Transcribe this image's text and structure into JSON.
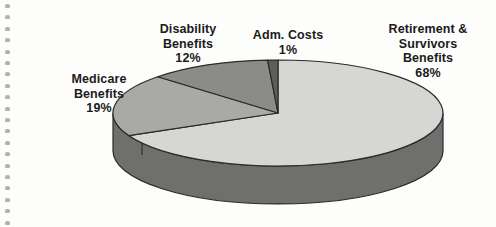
{
  "chart_data": {
    "type": "pie",
    "title": "",
    "subtitle": "",
    "xlabel": "",
    "ylabel": "",
    "legend_position": "none",
    "grid": false,
    "value_unit": "percent",
    "categories": [
      "Retirement & Survivors Benefits",
      "Medicare Benefits",
      "Disability Benefits",
      "Adm. Costs"
    ],
    "values": [
      68,
      19,
      12,
      1
    ],
    "labels": [
      "68%",
      "19%",
      "12%",
      "1%"
    ],
    "slices": [
      {
        "name": "Retirement & Survivors Benefits",
        "value": 68,
        "label": "68%",
        "color": "#d6d6d4",
        "start_angle_deg": 0,
        "end_angle_deg": 244.8
      },
      {
        "name": "Medicare Benefits",
        "value": 19,
        "label": "19%",
        "color": "#a9a9a6",
        "start_angle_deg": 244.8,
        "end_angle_deg": 313.2
      },
      {
        "name": "Disability Benefits",
        "value": 12,
        "label": "12%",
        "color": "#8b8b88",
        "start_angle_deg": 313.2,
        "end_angle_deg": 356.4
      },
      {
        "name": "Adm. Costs",
        "value": 1,
        "label": "1%",
        "color": "#5d5d5b",
        "start_angle_deg": 356.4,
        "end_angle_deg": 360
      }
    ],
    "side_wall_color": "#6f6f6d",
    "outline_color": "#2a2a2a",
    "background_color": "#fdfdfc"
  },
  "labels": {
    "retirement": {
      "line1": "Retirement &",
      "line2": "Survivors",
      "line3": "Benefits",
      "percent": "68%"
    },
    "medicare": {
      "line1": "Medicare",
      "line2": "Benefits",
      "percent": "19%"
    },
    "disability": {
      "line1": "Disability",
      "line2": "Benefits",
      "percent": "12%"
    },
    "adm_costs": {
      "line1": "Adm. Costs",
      "percent": "1%"
    }
  }
}
